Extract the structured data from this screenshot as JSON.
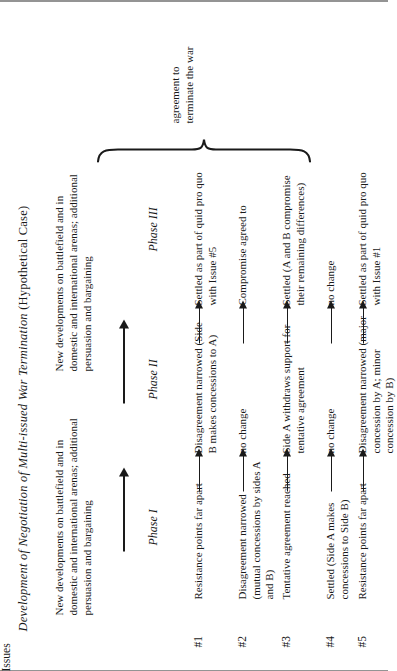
{
  "figure": {
    "title_italic": "Development of Negotiation of Multi-issued War Termination",
    "title_roman": "(Hypothetical Case)",
    "banners": [
      "New developments on battlefield and in domestic and international arenas; additional persuasion and bargaining",
      "New developments on battlefield and in domestic and international arenas; additional persuasion and bargaining"
    ],
    "issues_header": "Issues",
    "phase_headers": [
      "Phase I",
      "Phase II",
      "Phase III"
    ],
    "outcome": "agreement to terminate the war",
    "rows": [
      {
        "issue": "#1",
        "phase1": "Resistance points far apart",
        "phase2": "Disagreement narrowed (Side B makes concessions to A)",
        "phase3": "Settled as part of quid pro quo with Issue #5"
      },
      {
        "issue": "#2",
        "phase1": "Disagreement narrowed (mutual concessions by sides A and B)",
        "phase2": "no change",
        "phase3": "Compromise agreed to"
      },
      {
        "issue": "#3",
        "phase1": "Tentative agreement reached",
        "phase2": "Side A withdraws support for tentative agreement",
        "phase3": "Settled (A and B compromise their remaining differences)"
      },
      {
        "issue": "#4",
        "phase1": "Settled (Side A makes concessions to Side B)",
        "phase2": "no change",
        "phase3": "no change"
      },
      {
        "issue": "#5",
        "phase1": "Resistance points far apart",
        "phase2": "Disagreement narrowed (major concession by A; minor concession by B)",
        "phase3": "Settled as part of quid pro quo with Issue #1"
      }
    ]
  },
  "colors": {
    "ink": "#1a1a1a",
    "paper": "#ffffff",
    "rule": "#2b2b2b"
  }
}
